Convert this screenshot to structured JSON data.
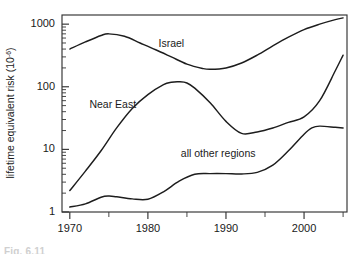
{
  "figure": {
    "caption": "Fig. 6.11",
    "background_color": "#ffffff",
    "ink_color": "#1d1d1d"
  },
  "chart_data": {
    "type": "line",
    "title": "",
    "subtitle": "",
    "xlabel": "",
    "ylabel": "lifetime equivalent risk (10",
    "ylabel_exponent": "-6",
    "ylabel_suffix": ")",
    "yscale": "log",
    "xscale": "linear",
    "xlim": [
      1969,
      2005.5
    ],
    "ylim": [
      1,
      1400
    ],
    "grid": false,
    "legend_position": "inline-labels",
    "xticks": [
      1970,
      1980,
      1990,
      2000
    ],
    "xtick_labels": [
      "1970",
      "1980",
      "1990",
      "2000"
    ],
    "xticks_minor": [
      1975,
      1985,
      1995,
      2005
    ],
    "yticks": [
      1,
      10,
      100,
      1000
    ],
    "ytick_labels": [
      "1",
      "10",
      "100",
      "1000"
    ],
    "yticks_minor": [
      2,
      3,
      4,
      5,
      6,
      7,
      8,
      9,
      20,
      30,
      40,
      50,
      60,
      70,
      80,
      90,
      200,
      300,
      400,
      500,
      600,
      700,
      800,
      900
    ],
    "series": [
      {
        "name": "Israel",
        "label": "Israel",
        "label_x": 1983,
        "label_y": 430,
        "x": [
          1970,
          1972,
          1974,
          1975,
          1977,
          1979,
          1981,
          1983,
          1985,
          1987,
          1988,
          1990,
          1992,
          1994,
          1996,
          1998,
          2000,
          2002,
          2004,
          2005
        ],
        "values": [
          400,
          520,
          660,
          700,
          640,
          500,
          390,
          300,
          230,
          196,
          190,
          200,
          240,
          320,
          450,
          620,
          820,
          1000,
          1180,
          1260
        ]
      },
      {
        "name": "Near East",
        "label": "Near East",
        "label_x": 1975.5,
        "label_y": 45,
        "x": [
          1970,
          1972,
          1974,
          1976,
          1978,
          1980,
          1982,
          1983,
          1984,
          1985,
          1986,
          1988,
          1990,
          1992,
          1994,
          1996,
          1998,
          2000,
          2002,
          2004,
          2005
        ],
        "values": [
          2.2,
          4.5,
          9.5,
          22,
          45,
          75,
          108,
          118,
          120,
          115,
          95,
          55,
          28,
          18,
          19,
          22,
          27,
          33,
          60,
          180,
          320
        ]
      },
      {
        "name": "all other regions",
        "label": "all other regions",
        "label_x": 1989,
        "label_y": 7.5,
        "x": [
          1970,
          1972,
          1974,
          1975,
          1976,
          1978,
          1980,
          1982,
          1984,
          1986,
          1988,
          1990,
          1992,
          1994,
          1996,
          1998,
          2000,
          2001,
          2002,
          2004,
          2005
        ],
        "values": [
          1.2,
          1.35,
          1.72,
          1.8,
          1.75,
          1.62,
          1.6,
          2.1,
          3.1,
          4.0,
          4.1,
          4.1,
          4.05,
          4.3,
          5.6,
          9.5,
          17.5,
          22,
          23.5,
          22.5,
          22
        ]
      }
    ]
  }
}
